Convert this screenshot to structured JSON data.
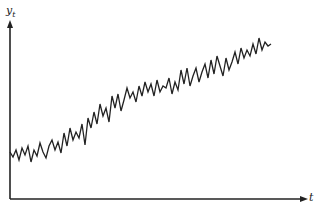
{
  "chart_data": {
    "type": "line",
    "title": "",
    "xlabel": "t",
    "ylabel": "y_t",
    "ylabel_main": "y",
    "ylabel_sub": "t",
    "grid": false,
    "legend": null,
    "line_color": "#222222",
    "axis_color": "#222222",
    "x_pixels": [
      10,
      13,
      16,
      19,
      22,
      25,
      28,
      31,
      34,
      37,
      40,
      43,
      46,
      49,
      52,
      55,
      58,
      61,
      64,
      67,
      70,
      73,
      76,
      79,
      82,
      85,
      88,
      91,
      94,
      97,
      100,
      103,
      106,
      109,
      112,
      115,
      118,
      121,
      124,
      127,
      130,
      133,
      136,
      139,
      142,
      145,
      148,
      151,
      154,
      157,
      160,
      163,
      166,
      169,
      172,
      175,
      178,
      181,
      184,
      187,
      190,
      193,
      196,
      199,
      202,
      205,
      208,
      211,
      214,
      217,
      220,
      223,
      226,
      229,
      232,
      235,
      238,
      241,
      244,
      247,
      250,
      253,
      256,
      259,
      262,
      265,
      268,
      271
    ],
    "y_pixels": [
      152,
      157,
      150,
      160,
      148,
      155,
      146,
      162,
      150,
      156,
      143,
      152,
      158,
      146,
      140,
      150,
      142,
      153,
      133,
      146,
      128,
      140,
      132,
      138,
      124,
      145,
      118,
      128,
      112,
      124,
      104,
      116,
      108,
      122,
      96,
      108,
      94,
      111,
      100,
      88,
      98,
      92,
      102,
      86,
      96,
      82,
      92,
      84,
      96,
      80,
      92,
      86,
      88,
      78,
      94,
      82,
      90,
      70,
      84,
      68,
      86,
      76,
      68,
      82,
      72,
      64,
      78,
      60,
      74,
      56,
      66,
      76,
      58,
      70,
      62,
      52,
      64,
      48,
      58,
      50,
      56,
      44,
      54,
      38,
      50,
      42,
      46,
      44
    ]
  }
}
